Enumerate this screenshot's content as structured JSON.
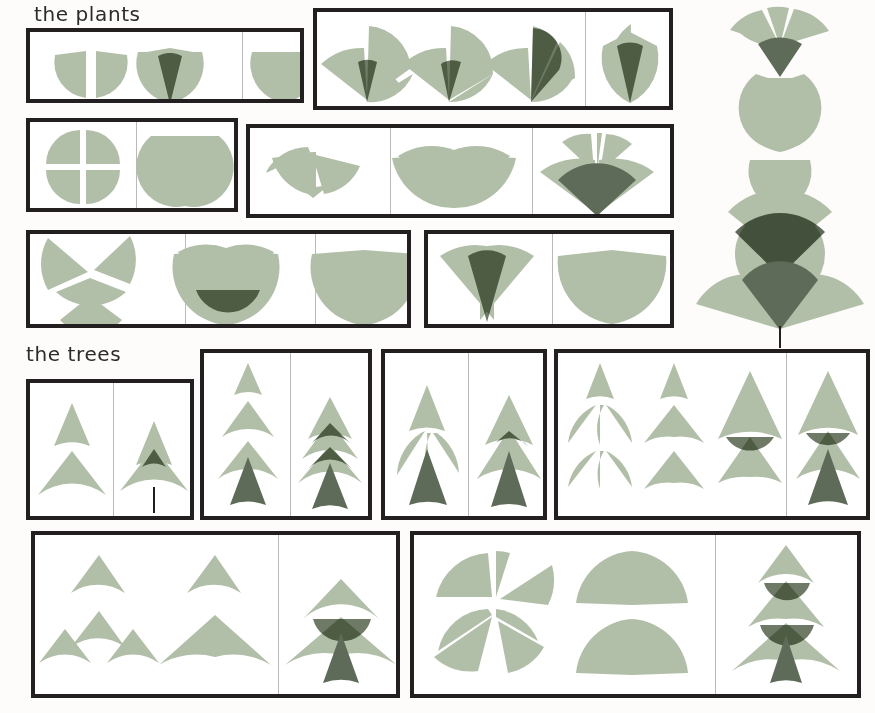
{
  "poster": {
    "width": 875,
    "height": 713,
    "background_color": "#fdfcfa",
    "panel_background": "#ffffff",
    "panel_border_color": "#231f20",
    "divider_color": "#b9b9b9"
  },
  "palette": {
    "leaf": "#b2bfa8",
    "leaf_overlap": "#8d9a85",
    "accent_dark": "#5f6b59",
    "ink": "#231f20",
    "paper": "#fdfcfa"
  },
  "headings": [
    {
      "id": "plants",
      "label": "the plants"
    },
    {
      "id": "trees",
      "label": "the trees"
    }
  ],
  "sections": [
    {
      "id": "plants",
      "label": "the plants",
      "panels": [
        {
          "id": "p-r1-left",
          "name": "plants-row1-left-panel",
          "x": 26,
          "y": 28,
          "w": 278,
          "h": 75,
          "dividers": [
            131,
            217
          ],
          "cells": 3
        },
        {
          "id": "p-r1-right",
          "name": "plants-row1-right-panel",
          "x": 313,
          "y": 8,
          "w": 360,
          "h": 102,
          "dividers": [
            268
          ],
          "cells": 2
        },
        {
          "id": "p-r2-left",
          "name": "plants-row2-left-panel",
          "x": 26,
          "y": 118,
          "w": 212,
          "h": 94,
          "dividers": [
            106
          ],
          "cells": 2
        },
        {
          "id": "p-r2-right",
          "name": "plants-row2-right-panel",
          "x": 246,
          "y": 124,
          "w": 428,
          "h": 94,
          "dividers": [
            140,
            282
          ],
          "cells": 3
        },
        {
          "id": "p-r3-left",
          "name": "plants-row3-left-panel",
          "x": 26,
          "y": 230,
          "w": 385,
          "h": 98,
          "dividers": [
            155,
            285
          ],
          "cells": 3
        },
        {
          "id": "p-r3-right",
          "name": "plants-row3-right-panel",
          "x": 424,
          "y": 230,
          "w": 250,
          "h": 98,
          "dividers": [
            124
          ],
          "cells": 2
        }
      ],
      "hero": {
        "name": "hero-flower-stem",
        "x": 690,
        "y": 4,
        "w": 180,
        "h": 336
      }
    },
    {
      "id": "trees",
      "label": "the trees",
      "panels": [
        {
          "id": "t-r1-a",
          "name": "trees-row1-panel-a",
          "x": 26,
          "y": 379,
          "w": 168,
          "h": 141,
          "dividers": [
            83
          ],
          "cells": 2
        },
        {
          "id": "t-r1-b",
          "name": "trees-row1-panel-b",
          "x": 200,
          "y": 349,
          "w": 172,
          "h": 171,
          "dividers": [
            86
          ],
          "cells": 2
        },
        {
          "id": "t-r1-c",
          "name": "trees-row1-panel-c",
          "x": 381,
          "y": 349,
          "w": 166,
          "h": 171,
          "dividers": [
            83
          ],
          "cells": 2
        },
        {
          "id": "t-r1-d",
          "name": "trees-row1-panel-d",
          "x": 554,
          "y": 349,
          "w": 316,
          "h": 171,
          "dividers": [
            228
          ],
          "cells": 2
        },
        {
          "id": "t-r2-a",
          "name": "trees-row2-panel-a",
          "x": 31,
          "y": 531,
          "w": 369,
          "h": 167,
          "dividers": [
            243
          ],
          "cells": 2
        },
        {
          "id": "t-r2-b",
          "name": "trees-row2-panel-b",
          "x": 410,
          "y": 531,
          "w": 451,
          "h": 167,
          "dividers": [
            301
          ],
          "cells": 2
        }
      ]
    }
  ],
  "figures": {
    "plants_row1": [
      {
        "name": "split-cup-two-quarters",
        "caption_order": 1
      },
      {
        "name": "cup-with-center-spear",
        "caption_order": 2
      },
      {
        "name": "plain-cup",
        "caption_order": 3
      }
    ],
    "plants_row1_right": [
      {
        "name": "bud-three-petal-open",
        "caption_order": 1
      },
      {
        "name": "bud-two-petal-lean",
        "caption_order": 2
      },
      {
        "name": "bud-four-petal-open",
        "caption_order": 3
      },
      {
        "name": "tulip-closed-two-petal",
        "caption_order": 4
      }
    ],
    "plants_row2": [
      {
        "name": "four-quarter-blossom",
        "caption_order": 1
      },
      {
        "name": "two-petal-tulip-solid",
        "caption_order": 2
      }
    ],
    "plants_row2_right": [
      {
        "name": "three-wedge-fan",
        "caption_order": 1
      },
      {
        "name": "wide-double-lobe",
        "caption_order": 2
      },
      {
        "name": "fan-with-dark-base",
        "caption_order": 3
      }
    ],
    "plants_row3": [
      {
        "name": "four-wedge-pinwheel",
        "caption_order": 1
      },
      {
        "name": "heart-with-dark-bowl",
        "caption_order": 2
      },
      {
        "name": "plain-heart",
        "caption_order": 3
      }
    ],
    "plants_row3_right": [
      {
        "name": "crossed-cone-pair",
        "caption_order": 1
      },
      {
        "name": "solid-chevron-heart",
        "caption_order": 2
      }
    ],
    "trees_row1_a": [
      {
        "name": "cone-pair-exploded",
        "caption_order": 1
      },
      {
        "name": "cone-tree-with-trunk-line",
        "caption_order": 2
      }
    ],
    "trees_row1_b": [
      {
        "name": "four-tier-exploded-cones",
        "caption_order": 1
      },
      {
        "name": "three-tier-tree-dark-trunk",
        "caption_order": 2
      }
    ],
    "trees_row1_c": [
      {
        "name": "split-tier-tree-exploded",
        "caption_order": 1
      },
      {
        "name": "cone-tree-overlap-trunk",
        "caption_order": 2
      }
    ],
    "trees_row1_d": [
      {
        "name": "wedge-grid-exploded",
        "caption_order": 1
      },
      {
        "name": "skirt-tier-exploded",
        "caption_order": 2
      },
      {
        "name": "two-tier-fir",
        "caption_order": 3
      },
      {
        "name": "three-tier-fir-dark-trunk",
        "caption_order": 4
      }
    ],
    "trees_row2_a": [
      {
        "name": "fan-parts-exploded",
        "caption_order": 1
      },
      {
        "name": "wide-canopy-pair",
        "caption_order": 2
      },
      {
        "name": "broad-fir-dark-trunk",
        "caption_order": 3
      }
    ],
    "trees_row2_b": [
      {
        "name": "wedge-cluster-exploded",
        "caption_order": 1
      },
      {
        "name": "stacked-canopy-pair",
        "caption_order": 2
      },
      {
        "name": "three-tier-broad-fir",
        "caption_order": 3
      }
    ]
  }
}
